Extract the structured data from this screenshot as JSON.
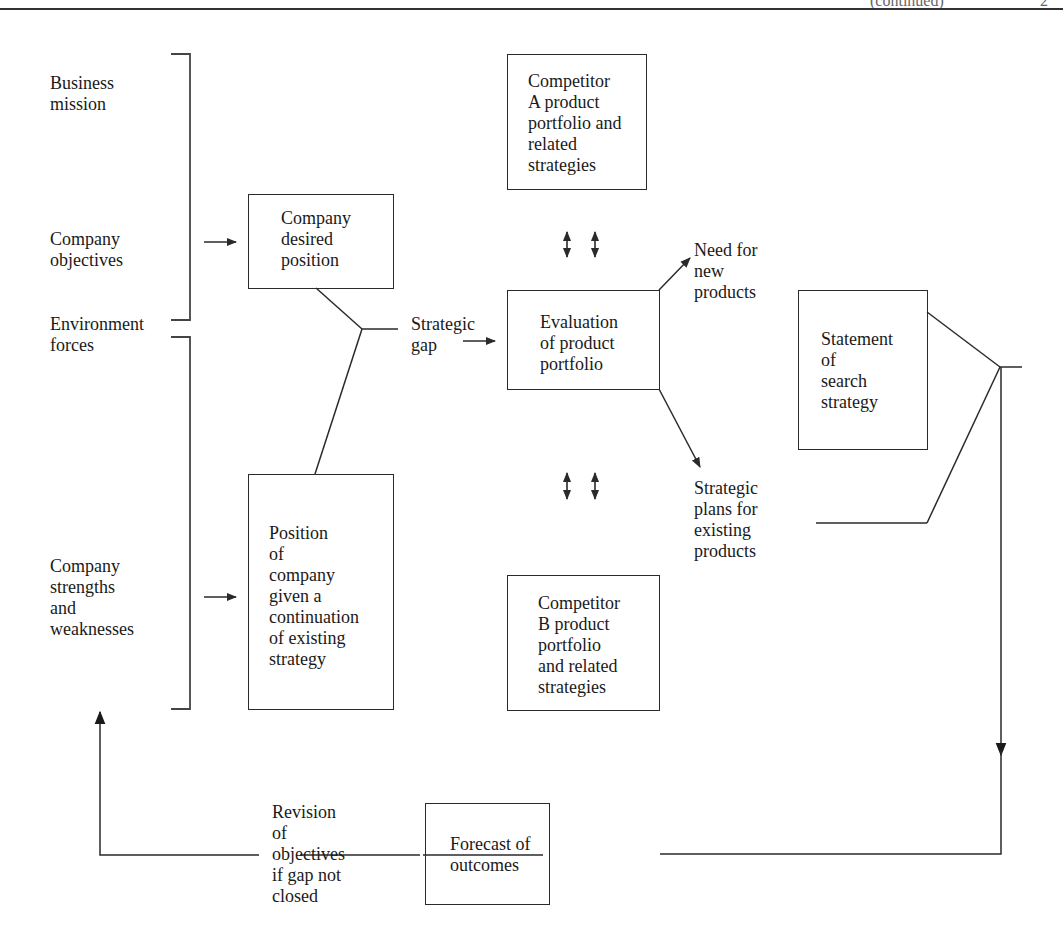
{
  "diagram": {
    "type": "strategic-gap-flowchart",
    "header_fragment": {
      "left_text": "(continued)",
      "right_text": "2"
    },
    "left_inputs": [
      {
        "id": "business_mission",
        "label": "Business\nmission"
      },
      {
        "id": "company_objectives",
        "label": "Company\nobjectives"
      },
      {
        "id": "environment_forces",
        "label": "Environment\nforces"
      },
      {
        "id": "company_strengths",
        "label": "Company\nstrengths\nand\nweaknesses"
      }
    ],
    "boxes": {
      "desired_position": {
        "label": "Company\ndesired\nposition"
      },
      "continuation_position": {
        "label": "Position\nof\ncompany\ngiven a\ncontinuation\nof existing\nstrategy"
      },
      "competitor_a": {
        "label": "Competitor\nA product\nportfolio and\nrelated\nstrategies"
      },
      "evaluation": {
        "label": "Evaluation\nof product\nportfolio"
      },
      "competitor_b": {
        "label": "Competitor\nB product\nportfolio\nand related\nstrategies"
      },
      "statement": {
        "label": "Statement\nof\nsearch\nstrategy"
      },
      "forecast": {
        "label": "Forecast of\noutcomes"
      }
    },
    "labels": {
      "strategic_gap": "Strategic\ngap",
      "need_new_products": "Need for\nnew\nproducts",
      "strategic_plans": "Strategic\nplans for\nexisting\nproducts",
      "revision": "Revision\nof\nobjectives\nif gap not\nclosed"
    },
    "connections": [
      {
        "from": "business_mission+company_objectives+environment_forces",
        "to": "desired_position",
        "kind": "arrow"
      },
      {
        "from": "environment_forces+company_strengths",
        "to": "continuation_position",
        "kind": "arrow"
      },
      {
        "from": "desired_position+continuation_position",
        "to": "strategic_gap",
        "kind": "merge"
      },
      {
        "from": "strategic_gap",
        "to": "evaluation",
        "kind": "arrow"
      },
      {
        "from": "competitor_a",
        "to": "evaluation",
        "kind": "double-arrow"
      },
      {
        "from": "competitor_b",
        "to": "evaluation",
        "kind": "double-arrow"
      },
      {
        "from": "evaluation",
        "to": "need_new_products",
        "kind": "arrow"
      },
      {
        "from": "evaluation",
        "to": "strategic_plans",
        "kind": "arrow"
      },
      {
        "from": "statement+strategic_plans",
        "to": "forecast",
        "kind": "merge-arrow"
      },
      {
        "from": "forecast",
        "to": "company_strengths",
        "via": "revision",
        "kind": "feedback-arrow"
      }
    ],
    "colors": {
      "line": "#2a2a2a",
      "text": "#1a1a1a",
      "background": "#ffffff"
    }
  }
}
